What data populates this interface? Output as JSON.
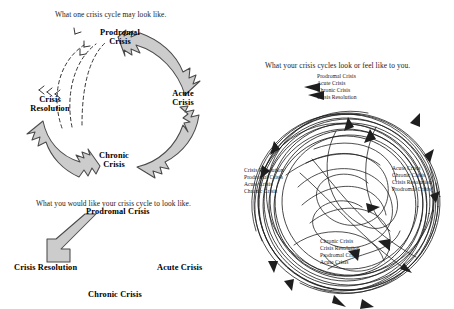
{
  "page": {
    "background": "#ffffff",
    "ink": "#111111",
    "arrow_fill": "#cccccc",
    "arrow_stroke": "#4a4a4a"
  },
  "panel_one": {
    "caption": "What one crisis cycle may look like.",
    "stages": [
      {
        "id": "prodromal",
        "line1": "Prodromal",
        "line2": "Crisis"
      },
      {
        "id": "acute",
        "line1": "Acute",
        "line2": "Crisis"
      },
      {
        "id": "chronic",
        "line1": "Chronic",
        "line2": "Crisis"
      },
      {
        "id": "resolution",
        "line1": "Crisis",
        "line2": "Resolution"
      }
    ],
    "arrows": {
      "solid_count": 3,
      "dashed_count": 3,
      "direction": "clockwise",
      "dashed_note": "return loops from Crisis Resolution to Prodromal Crisis"
    }
  },
  "panel_two": {
    "caption": "What you would like your crisis cycle to look like.",
    "stages": [
      {
        "id": "prodromal",
        "label": "Prodromal Crisis"
      },
      {
        "id": "resolution",
        "label": "Crisis Resolution"
      },
      {
        "id": "acute",
        "label": "Acute Crisis"
      },
      {
        "id": "chronic",
        "label": "Chronic Crisis"
      }
    ],
    "arrows": {
      "solid_count": 1,
      "direction": "prodromal-to-resolution-diagonal"
    }
  },
  "panel_three": {
    "caption": "What your crisis cycles look or feel like to you.",
    "label_clusters": [
      {
        "id": "top",
        "position": "top",
        "lines": [
          "Prodromal Crisis",
          "Acute Crisis",
          "Chronic Crisis",
          "Crisis Resolution"
        ]
      },
      {
        "id": "left",
        "position": "left",
        "lines": [
          "Crisis Resolution",
          "Prodromal Crisis",
          "Acute Crisis",
          "Chronic Crisis"
        ]
      },
      {
        "id": "right",
        "position": "right",
        "lines": [
          "Acute Crisis",
          "Chronic Crisis",
          "Crisis Resolution",
          "Prodromal Crisis"
        ]
      },
      {
        "id": "bottom",
        "position": "bottom",
        "lines": [
          "Chronic Crisis",
          "Crisis Resolution",
          "Prodromal Crisis",
          "Acute Crisis"
        ]
      }
    ],
    "arcs": {
      "outer_ring_count": 14,
      "inner_tangle_count": 9,
      "arrowheads": 14
    }
  }
}
